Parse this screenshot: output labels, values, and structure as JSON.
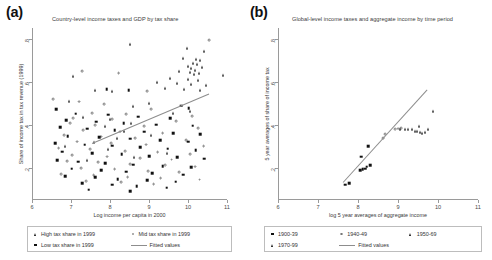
{
  "figure": {
    "panels": [
      {
        "tag": "(a)",
        "title": "Country-level income taxes and GDP by tax share",
        "xlabel": "Log income per capita in 2000",
        "ylabel": "Share of income tax in tax revenue (1999)",
        "xticks": [
          "6",
          "7",
          "8",
          "9",
          "10",
          "11"
        ],
        "yticks": [
          ".2",
          ".4",
          ".6",
          ".8"
        ],
        "legend": [
          {
            "marker": "tri",
            "label": "High tax share in 1999"
          },
          {
            "marker": "circ",
            "label": "Mid tax share in 1999"
          },
          {
            "marker": "sq",
            "label": "Low tax share in 1999"
          },
          {
            "marker": "line",
            "label": "Fitted values"
          }
        ]
      },
      {
        "tag": "(b)",
        "title": "Global-level income taxes and aggregate income by time period",
        "xlabel": "log 5 year averages of aggregate income",
        "ylabel": "5 year averages of share of income tax",
        "xticks": [
          "6",
          "7",
          "8",
          "9",
          "10",
          "11"
        ],
        "yticks": [
          ".2",
          ".4",
          ".6",
          ".8"
        ],
        "legend": [
          {
            "marker": "sq",
            "label": "1900-39"
          },
          {
            "marker": "circ",
            "label": "1940-49"
          },
          {
            "marker": "tri",
            "label": "1950-69"
          },
          {
            "marker": "tri",
            "label": "1970-99"
          },
          {
            "marker": "line",
            "label": "Fitted values"
          }
        ]
      }
    ]
  },
  "chart_data": [
    {
      "type": "scatter",
      "panel": "(a)",
      "title": "Country-level income taxes and GDP by tax share",
      "xlabel": "Log income per capita in 2000",
      "ylabel": "Share of income tax in tax revenue (1999)",
      "xlim": [
        6,
        11
      ],
      "ylim": [
        0.05,
        0.85
      ],
      "grid": false,
      "legend_position": "below-axes",
      "fit_line": {
        "x": [
          7.55,
          10.55
        ],
        "y": [
          0.315,
          0.545
        ]
      },
      "series": [
        {
          "name": "High tax share in 1999",
          "marker": "triangle",
          "points": [
            [
              8.52,
              0.775
            ],
            [
              9.98,
              0.755
            ],
            [
              10.42,
              0.745
            ],
            [
              9.88,
              0.712
            ],
            [
              10.2,
              0.705
            ],
            [
              10.3,
              0.7
            ],
            [
              10.12,
              0.688
            ],
            [
              10.22,
              0.682
            ],
            [
              10.0,
              0.672
            ],
            [
              10.35,
              0.668
            ],
            [
              10.08,
              0.662
            ],
            [
              10.18,
              0.655
            ],
            [
              9.78,
              0.648
            ],
            [
              10.05,
              0.645
            ],
            [
              10.28,
              0.64
            ],
            [
              10.15,
              0.635
            ],
            [
              10.9,
              0.632
            ],
            [
              9.55,
              0.618
            ],
            [
              10.0,
              0.612
            ],
            [
              10.25,
              0.606
            ],
            [
              9.2,
              0.6
            ],
            [
              9.72,
              0.596
            ],
            [
              10.08,
              0.59
            ],
            [
              10.45,
              0.586
            ],
            [
              9.42,
              0.572
            ],
            [
              9.9,
              0.566
            ],
            [
              10.3,
              0.56
            ],
            [
              7.05,
              0.625
            ],
            [
              7.62,
              0.56
            ],
            [
              8.05,
              0.556
            ],
            [
              6.95,
              0.512
            ],
            [
              9.0,
              0.5
            ],
            [
              8.58,
              0.486
            ],
            [
              10.05,
              0.465
            ],
            [
              9.62,
              0.455
            ],
            [
              7.3,
              0.436
            ],
            [
              8.0,
              0.425
            ],
            [
              8.55,
              0.408
            ],
            [
              7.88,
              0.392
            ],
            [
              8.35,
              0.372
            ],
            [
              9.05,
              0.352
            ],
            [
              8.18,
              0.338
            ],
            [
              7.6,
              0.322
            ],
            [
              6.85,
              0.3
            ],
            [
              7.95,
              0.286
            ],
            [
              9.45,
              0.268
            ],
            [
              8.62,
              0.252
            ],
            [
              7.42,
              0.236
            ]
          ]
        },
        {
          "name": "Mid tax share in 1999",
          "marker": "open-circle",
          "points": [
            [
              10.55,
              0.792
            ],
            [
              7.28,
              0.648
            ],
            [
              8.22,
              0.64
            ],
            [
              8.95,
              0.555
            ],
            [
              6.55,
              0.52
            ],
            [
              7.2,
              0.508
            ],
            [
              7.85,
              0.495
            ],
            [
              9.05,
              0.472
            ],
            [
              7.55,
              0.455
            ],
            [
              8.42,
              0.448
            ],
            [
              10.1,
              0.44
            ],
            [
              7.05,
              0.432
            ],
            [
              8.05,
              0.425
            ],
            [
              9.7,
              0.418
            ],
            [
              6.98,
              0.408
            ],
            [
              7.62,
              0.4
            ],
            [
              8.88,
              0.392
            ],
            [
              10.25,
              0.385
            ],
            [
              7.32,
              0.375
            ],
            [
              8.25,
              0.368
            ],
            [
              9.35,
              0.36
            ],
            [
              6.82,
              0.352
            ],
            [
              7.78,
              0.345
            ],
            [
              8.65,
              0.338
            ],
            [
              9.95,
              0.33
            ],
            [
              7.15,
              0.322
            ],
            [
              8.02,
              0.315
            ],
            [
              8.92,
              0.308
            ],
            [
              10.4,
              0.3
            ],
            [
              6.68,
              0.292
            ],
            [
              7.48,
              0.285
            ],
            [
              8.38,
              0.278
            ],
            [
              9.22,
              0.272
            ],
            [
              10.05,
              0.265
            ],
            [
              7.02,
              0.258
            ],
            [
              7.92,
              0.252
            ],
            [
              8.78,
              0.245
            ],
            [
              9.58,
              0.238
            ],
            [
              6.9,
              0.232
            ],
            [
              7.7,
              0.225
            ],
            [
              8.52,
              0.218
            ],
            [
              9.42,
              0.212
            ],
            [
              10.18,
              0.205
            ],
            [
              7.25,
              0.198
            ],
            [
              8.12,
              0.192
            ],
            [
              8.98,
              0.185
            ],
            [
              9.78,
              0.178
            ],
            [
              6.75,
              0.172
            ],
            [
              7.58,
              0.165
            ],
            [
              8.45,
              0.158
            ],
            [
              9.3,
              0.152
            ],
            [
              10.3,
              0.145
            ],
            [
              7.38,
              0.138
            ],
            [
              8.28,
              0.132
            ],
            [
              9.12,
              0.125
            ]
          ]
        },
        {
          "name": "Low tax share in 1999",
          "marker": "filled-square",
          "points": [
            [
              7.92,
              0.565
            ],
            [
              8.48,
              0.56
            ],
            [
              6.62,
              0.472
            ],
            [
              9.82,
              0.488
            ],
            [
              10.02,
              0.478
            ],
            [
              7.12,
              0.452
            ],
            [
              7.95,
              0.446
            ],
            [
              8.72,
              0.438
            ],
            [
              9.55,
              0.43
            ],
            [
              6.88,
              0.422
            ],
            [
              7.65,
              0.415
            ],
            [
              8.35,
              0.408
            ],
            [
              9.18,
              0.4
            ],
            [
              10.12,
              0.395
            ],
            [
              6.72,
              0.388
            ],
            [
              7.42,
              0.382
            ],
            [
              8.12,
              0.375
            ],
            [
              8.88,
              0.368
            ],
            [
              9.62,
              0.362
            ],
            [
              10.32,
              0.355
            ],
            [
              6.92,
              0.348
            ],
            [
              7.72,
              0.342
            ],
            [
              8.52,
              0.335
            ],
            [
              9.28,
              0.328
            ],
            [
              10.0,
              0.322
            ],
            [
              6.6,
              0.315
            ],
            [
              7.35,
              0.308
            ],
            [
              8.05,
              0.302
            ],
            [
              8.78,
              0.295
            ],
            [
              9.48,
              0.288
            ],
            [
              10.2,
              0.282
            ],
            [
              6.78,
              0.275
            ],
            [
              7.55,
              0.268
            ],
            [
              8.3,
              0.262
            ],
            [
              9.0,
              0.255
            ],
            [
              9.72,
              0.248
            ],
            [
              10.42,
              0.242
            ],
            [
              6.65,
              0.235
            ],
            [
              7.18,
              0.228
            ],
            [
              7.88,
              0.222
            ],
            [
              8.6,
              0.215
            ],
            [
              9.35,
              0.208
            ],
            [
              10.08,
              0.202
            ],
            [
              7.02,
              0.195
            ],
            [
              7.78,
              0.188
            ],
            [
              8.42,
              0.182
            ],
            [
              9.08,
              0.175
            ],
            [
              9.88,
              0.168
            ],
            [
              6.85,
              0.162
            ],
            [
              7.62,
              0.155
            ],
            [
              8.2,
              0.148
            ],
            [
              8.95,
              0.142
            ],
            [
              9.68,
              0.135
            ],
            [
              7.28,
              0.128
            ],
            [
              8.05,
              0.122
            ],
            [
              8.68,
              0.115
            ],
            [
              9.45,
              0.108
            ],
            [
              7.45,
              0.098
            ],
            [
              8.52,
              0.092
            ]
          ]
        }
      ]
    },
    {
      "type": "scatter",
      "panel": "(b)",
      "title": "Global-level income taxes and aggregate income by time period",
      "xlabel": "log 5 year averages of aggregate income",
      "ylabel": "5 year averages of share of income tax",
      "xlim": [
        6,
        11
      ],
      "ylim": [
        0.05,
        0.85
      ],
      "grid": false,
      "legend_position": "below-axes",
      "fit_line": {
        "x": [
          7.62,
          9.72
        ],
        "y": [
          0.135,
          0.565
        ]
      },
      "series": [
        {
          "name": "1900-39",
          "marker": "filled-square",
          "points": [
            [
              7.68,
              0.122
            ],
            [
              7.78,
              0.128
            ],
            [
              8.05,
              0.188
            ],
            [
              8.12,
              0.192
            ],
            [
              8.18,
              0.196
            ],
            [
              8.22,
              0.205
            ],
            [
              8.3,
              0.212
            ],
            [
              8.08,
              0.252
            ],
            [
              8.25,
              0.3
            ]
          ]
        },
        {
          "name": "1940-49",
          "marker": "open-circle",
          "points": [
            [
              8.62,
              0.338
            ],
            [
              8.68,
              0.358
            ],
            [
              8.92,
              0.378
            ],
            [
              9.0,
              0.382
            ],
            [
              9.08,
              0.386
            ]
          ]
        },
        {
          "name": "1950-69",
          "marker": "triangle",
          "points": [
            [
              9.05,
              0.382
            ],
            [
              9.18,
              0.38
            ],
            [
              9.25,
              0.382
            ],
            [
              9.35,
              0.378
            ],
            [
              9.42,
              0.372
            ]
          ]
        },
        {
          "name": "1970-99",
          "marker": "triangle",
          "points": [
            [
              9.48,
              0.372
            ],
            [
              9.55,
              0.366
            ],
            [
              9.6,
              0.362
            ],
            [
              9.68,
              0.368
            ],
            [
              9.75,
              0.378
            ],
            [
              9.52,
              0.395
            ],
            [
              9.88,
              0.465
            ]
          ]
        }
      ]
    }
  ]
}
